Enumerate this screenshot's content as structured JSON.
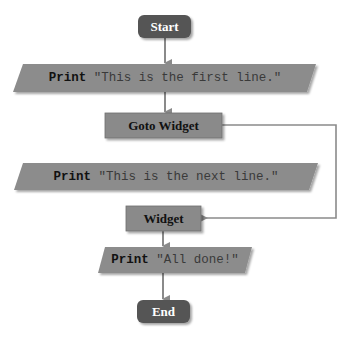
{
  "diagram": {
    "type": "flowchart",
    "colors": {
      "terminal_fill": "#555555",
      "process_fill": "#8a8a8a",
      "io_fill": "#8c8c8c",
      "connector": "#8a8a8a",
      "background": "#ffffff"
    },
    "nodes": [
      {
        "id": "start",
        "shape": "terminal",
        "label": "Start"
      },
      {
        "id": "print1",
        "shape": "io",
        "keyword": "Print",
        "text": "\"This is the first line.\""
      },
      {
        "id": "goto",
        "shape": "process",
        "label": "Goto Widget"
      },
      {
        "id": "print2",
        "shape": "io",
        "keyword": "Print",
        "text": "\"This is the next line.\""
      },
      {
        "id": "widget",
        "shape": "process",
        "label": "Widget"
      },
      {
        "id": "print3",
        "shape": "io",
        "keyword": "Print",
        "text": "\"All done!\""
      },
      {
        "id": "end",
        "shape": "terminal",
        "label": "End"
      }
    ],
    "edges": [
      {
        "from": "start",
        "to": "print1"
      },
      {
        "from": "print1",
        "to": "goto"
      },
      {
        "from": "goto",
        "to": "widget",
        "route": "right-side bypass"
      },
      {
        "from": "widget",
        "to": "print3"
      },
      {
        "from": "print3",
        "to": "end"
      }
    ]
  }
}
